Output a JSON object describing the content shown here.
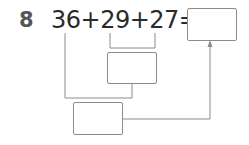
{
  "problem": {
    "number": "8",
    "expression": "36+29+27=",
    "terms": [
      "36",
      "29",
      "27"
    ],
    "answer_box": "",
    "intermediate_box_1": "",
    "intermediate_box_2": ""
  },
  "colors": {
    "line": "#8c8c8c",
    "text": "#2a2a2a",
    "number": "#555555"
  }
}
